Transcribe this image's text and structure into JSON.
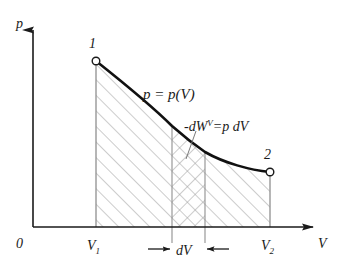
{
  "figure": {
    "type": "pressure-volume-work-diagram",
    "background_color": "#ffffff",
    "ink_color": "#1a1a1a",
    "hatch_color": "#9a9a9a"
  },
  "axes": {
    "y_axis_label": "p",
    "x_axis_label": "V",
    "origin_label": "0",
    "y_axis_x": 33,
    "x_axis_y": 227,
    "y_axis_top": 18,
    "x_axis_right": 318
  },
  "curve": {
    "label": "p = p(V)",
    "label_parts": {
      "lhs": "p",
      "equals": "=",
      "rhs_function": "p",
      "rhs_open": "(",
      "rhs_arg": "V",
      "rhs_close": ")"
    },
    "start_point": {
      "name": "1",
      "x": 96,
      "y": 61
    },
    "end_point": {
      "name": "2",
      "x": 270,
      "y": 172
    }
  },
  "points": [
    {
      "label": "1",
      "marker": "open-circle",
      "x": 96,
      "y": 61
    },
    {
      "label": "2",
      "marker": "open-circle",
      "x": 270,
      "y": 172
    }
  ],
  "work_element": {
    "label_full": "-dW",
    "label_superscript": "V",
    "label_equals": "=",
    "label_rhs": "p dV",
    "strip_left_x": 172,
    "strip_right_x": 205,
    "hatch_style": "cross-hatch"
  },
  "dimension": {
    "label": "dV",
    "left_arrow": "arrow-right",
    "right_arrow": "arrow-left"
  },
  "tick_labels": {
    "v1": {
      "base": "V",
      "sub": "1",
      "x": 96
    },
    "v2": {
      "base": "V",
      "sub": "2",
      "x": 270
    }
  },
  "regions": [
    {
      "name": "left-area",
      "hatch": "single-diagonal"
    },
    {
      "name": "dv-strip",
      "hatch": "cross-hatch"
    },
    {
      "name": "right-area",
      "hatch": "single-diagonal"
    }
  ]
}
